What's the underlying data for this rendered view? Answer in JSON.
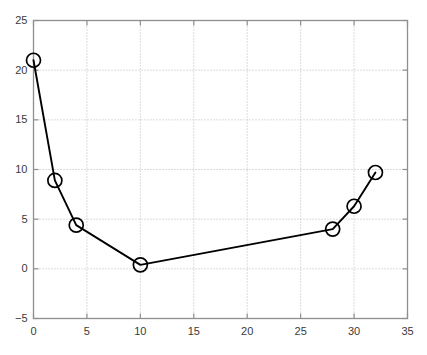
{
  "chart_data": {
    "type": "line",
    "title": "",
    "subtitle": "",
    "xlabel": "",
    "ylabel": "",
    "xlim": [
      0,
      35
    ],
    "ylim": [
      -5,
      25
    ],
    "xticks": [
      0,
      5,
      10,
      15,
      20,
      25,
      30,
      35
    ],
    "yticks": [
      -5,
      0,
      5,
      10,
      15,
      20,
      25
    ],
    "xtick_labels": [
      "0",
      "5",
      "10",
      "15",
      "20",
      "25",
      "30",
      "35"
    ],
    "ytick_labels": [
      "−5",
      "0",
      "5",
      "10",
      "15",
      "20",
      "25"
    ],
    "grid": true,
    "grid_style": "dotted",
    "legend": null,
    "legend_position": "none",
    "annotations": [],
    "series": [
      {
        "name": "series-1",
        "marker": "circle",
        "marker_size": 7,
        "line_color": "#000000",
        "marker_color": "#000000",
        "x": [
          0,
          2,
          4,
          10,
          28,
          30,
          32
        ],
        "y": [
          21.0,
          8.9,
          4.4,
          0.4,
          4.0,
          6.3,
          9.7
        ],
        "points": [
          {
            "x": 0,
            "y": 21.0
          },
          {
            "x": 2,
            "y": 8.9
          },
          {
            "x": 4,
            "y": 4.4
          },
          {
            "x": 10,
            "y": 0.4
          },
          {
            "x": 28,
            "y": 4.0
          },
          {
            "x": 30,
            "y": 6.3
          },
          {
            "x": 32,
            "y": 9.7
          }
        ]
      }
    ],
    "colors": {
      "background": "#ffffff",
      "axis": "#8f8f8f",
      "grid": "#b9b9b9",
      "data": "#000000",
      "text": "#3a3a3a"
    }
  }
}
